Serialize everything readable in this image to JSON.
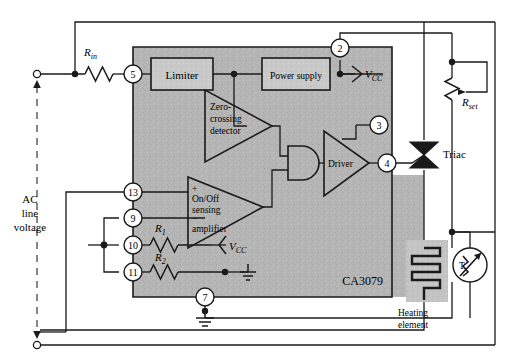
{
  "figure": {
    "chip_label": "CA3079"
  },
  "blocks": {
    "limiter": "Limiter",
    "power_supply": "Power supply",
    "zero_crossing": [
      "Zero-",
      "crossing",
      "detector"
    ],
    "sensing_amp": [
      "On/Off",
      "sensing",
      "amplifier"
    ],
    "driver": "Driver"
  },
  "pins": [
    {
      "number": "5",
      "name": "pin-5"
    },
    {
      "number": "2",
      "name": "pin-2"
    },
    {
      "number": "3",
      "name": "pin-3"
    },
    {
      "number": "4",
      "name": "pin-4"
    },
    {
      "number": "13",
      "name": "pin-13"
    },
    {
      "number": "9",
      "name": "pin-9"
    },
    {
      "number": "10",
      "name": "pin-10"
    },
    {
      "number": "11",
      "name": "pin-11"
    },
    {
      "number": "7",
      "name": "pin-7"
    }
  ],
  "components": {
    "r_in": {
      "symbol": "R",
      "sub": "in"
    },
    "r_set": {
      "symbol": "R",
      "sub": "set"
    },
    "r1": {
      "symbol": "R",
      "sub": "1"
    },
    "r2": {
      "symbol": "R",
      "sub": "2"
    },
    "triac": "Triac",
    "heating_element": [
      "Heating",
      "element"
    ],
    "thermistor": "T"
  },
  "supply": {
    "vcc_top": {
      "symbol": "V",
      "sub": "CC"
    },
    "vcc_mid": {
      "symbol": "V",
      "sub": "CC"
    }
  },
  "source": {
    "line1": "AC",
    "line2": "line",
    "line3": "voltage"
  },
  "amp_signs": {
    "plus": "+",
    "minus": "−"
  },
  "colors": {
    "line": "#1a1a1a",
    "chip_fill": "#b5b5b5",
    "block_fill": "#c9c9c9",
    "heater_fill": "#c4c4c4",
    "background": "#ffffff"
  }
}
